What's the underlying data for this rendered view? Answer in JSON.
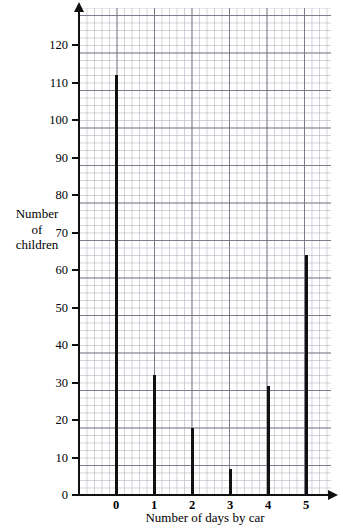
{
  "chart_data": {
    "type": "bar",
    "title": "",
    "subtitle": "",
    "xlabel": "Number of days by car",
    "ylabel_lines": [
      "Number",
      "of",
      "children"
    ],
    "ylabel": "Number of children",
    "categories": [
      "0",
      "1",
      "2",
      "3",
      "4",
      "5"
    ],
    "values": [
      112,
      32,
      18,
      7,
      29,
      64
    ],
    "xlim": [
      -0.5,
      6.0
    ],
    "ylim": [
      0,
      130
    ],
    "ytick_labels": [
      "0",
      "10",
      "20",
      "30",
      "40",
      "50",
      "60",
      "70",
      "80",
      "90",
      "100",
      "110",
      "120"
    ],
    "ytick_values": [
      0,
      10,
      20,
      30,
      40,
      50,
      60,
      70,
      80,
      90,
      100,
      110,
      120
    ],
    "xtick_labels": [
      "0",
      "1",
      "2",
      "3",
      "4",
      "5"
    ],
    "grid": "graph-paper-minor-and-major",
    "legend": "none",
    "legend_position": "none",
    "bar_style": "thin vertical lines",
    "colors": {
      "bar": "#111111",
      "axis": "#111111",
      "grid_major": "#6e6e7d",
      "grid_minor": "#aaaab9",
      "background": "#ffffff"
    },
    "axis_arrows": [
      "y-axis-up",
      "x-axis-right"
    ]
  }
}
